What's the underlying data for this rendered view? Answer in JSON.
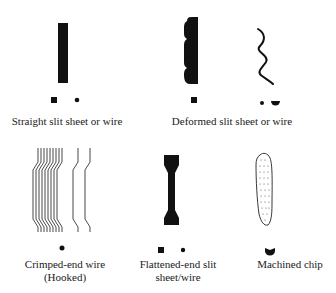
{
  "figure": {
    "fibers": [
      {
        "id": "straight",
        "label_lines": [
          "Straight slit sheet or wire"
        ],
        "cross_sections": [
          "square",
          "circle"
        ]
      },
      {
        "id": "deformed",
        "label_lines": [
          "Deformed slit sheet or wire"
        ],
        "cross_sections": [
          "square",
          "circle",
          "half-circle"
        ]
      },
      {
        "id": "crimped",
        "label_lines": [
          "Crimped-end wire",
          "(Hooked)"
        ],
        "cross_sections": [
          "circle"
        ]
      },
      {
        "id": "flattened",
        "label_lines": [
          "Flattened-end slit",
          "sheet/wire"
        ],
        "cross_sections": [
          "square",
          "circle"
        ]
      },
      {
        "id": "machined",
        "label_lines": [
          "Machined chip"
        ],
        "cross_sections": [
          "crescent"
        ]
      }
    ],
    "colors": {
      "ink": "#111111",
      "background": "#ffffff"
    }
  }
}
